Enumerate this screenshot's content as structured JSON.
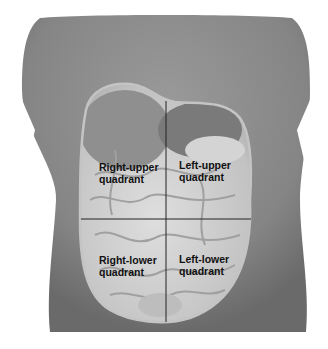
{
  "figure": {
    "quadrants": [
      {
        "id": "ruq",
        "label": "Right-upper\nquadrant"
      },
      {
        "id": "luq",
        "label": "Left-upper\nquadrant"
      },
      {
        "id": "rlq",
        "label": "Right-lower\nquadrant"
      },
      {
        "id": "llq",
        "label": "Left-lower\nquadrant"
      }
    ],
    "colors": {
      "torso": "#8a8a8a",
      "torso_dark": "#6e6e6e",
      "organs": "#c9c9c9",
      "organs_light": "#e2e2e2",
      "outline": "#b8b8b8",
      "divider": "#222222",
      "background": "#ffffff"
    }
  }
}
